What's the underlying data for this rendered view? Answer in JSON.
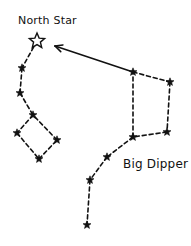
{
  "diagram": {
    "labels": {
      "north_star": "North Star",
      "big_dipper": "Big Dipper"
    },
    "colors": {
      "ink": "#111111",
      "background": "#ffffff"
    },
    "north_star": {
      "x": 37,
      "y": 41,
      "style": "hollow"
    },
    "little_dipper": {
      "stars": [
        [
          37,
          41
        ],
        [
          22,
          68
        ],
        [
          20,
          93
        ],
        [
          33,
          115
        ],
        [
          17,
          133
        ],
        [
          39,
          159
        ],
        [
          57,
          140
        ]
      ],
      "lines": [
        [
          0,
          1
        ],
        [
          1,
          2
        ],
        [
          2,
          3
        ],
        [
          3,
          4
        ],
        [
          4,
          5
        ],
        [
          5,
          6
        ],
        [
          6,
          3
        ]
      ]
    },
    "big_dipper": {
      "stars": [
        [
          133,
          72
        ],
        [
          170,
          82
        ],
        [
          167,
          132
        ],
        [
          133,
          137
        ],
        [
          107,
          157
        ],
        [
          90,
          180
        ],
        [
          87,
          225
        ]
      ],
      "lines": [
        [
          0,
          1
        ],
        [
          1,
          2
        ],
        [
          2,
          3
        ],
        [
          3,
          0
        ],
        [
          3,
          4
        ],
        [
          4,
          5
        ],
        [
          5,
          6
        ]
      ]
    },
    "pointer_arrow": {
      "from": [
        133,
        72
      ],
      "to": [
        55,
        46
      ]
    }
  }
}
